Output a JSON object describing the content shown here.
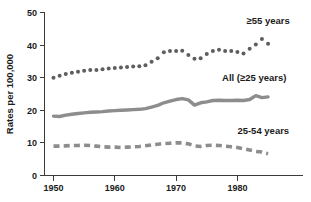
{
  "chart_data": {
    "type": "line",
    "title": "",
    "xlabel": "",
    "ylabel": "Rates per 100,000",
    "xlim": [
      1949,
      1986
    ],
    "ylim": [
      0,
      50
    ],
    "xticks": [
      1950,
      1960,
      1970,
      1980
    ],
    "xtick_labels": [
      "1950",
      "1960",
      "1970",
      "1980"
    ],
    "yticks": [
      0,
      10,
      20,
      30,
      40,
      50
    ],
    "ytick_labels": [
      "0",
      "10",
      "20",
      "30",
      "40",
      "50"
    ],
    "grid": false,
    "legend_position": "inline-right",
    "x": [
      1950,
      1951,
      1952,
      1953,
      1954,
      1955,
      1956,
      1957,
      1958,
      1959,
      1960,
      1961,
      1962,
      1963,
      1964,
      1965,
      1966,
      1967,
      1968,
      1969,
      1970,
      1971,
      1972,
      1973,
      1974,
      1975,
      1976,
      1977,
      1978,
      1979,
      1980,
      1981,
      1982,
      1983,
      1984,
      1985
    ],
    "series": [
      {
        "name": "≥55 years",
        "style": "dotted",
        "color": "#5e5e5e",
        "values": [
          30.0,
          30.6,
          31.1,
          31.5,
          31.8,
          32.1,
          32.4,
          32.4,
          32.6,
          32.8,
          33.0,
          33.1,
          33.3,
          33.4,
          33.5,
          33.8,
          34.9,
          36.0,
          37.8,
          38.2,
          38.2,
          38.3,
          37.0,
          35.8,
          36.0,
          37.3,
          38.2,
          38.6,
          38.2,
          38.2,
          37.9,
          37.4,
          38.9,
          40.2,
          41.9,
          40.4
        ]
      },
      {
        "name": "All (≥25 years)",
        "style": "solid",
        "color": "#8d8d8d",
        "values": [
          18.2,
          18.1,
          18.5,
          18.8,
          19.0,
          19.2,
          19.4,
          19.5,
          19.6,
          19.8,
          19.9,
          20.0,
          20.1,
          20.2,
          20.3,
          20.5,
          21.0,
          21.5,
          22.3,
          22.8,
          23.3,
          23.6,
          23.2,
          21.6,
          22.3,
          22.6,
          23.0,
          23.1,
          23.0,
          23.0,
          23.1,
          23.0,
          23.3,
          24.5,
          23.9,
          24.1
        ]
      },
      {
        "name": "25-54 years",
        "style": "dashed",
        "color": "#8d8d8d",
        "values": [
          9.0,
          9.0,
          9.1,
          9.2,
          9.2,
          9.3,
          9.2,
          9.0,
          8.8,
          8.7,
          8.7,
          8.6,
          8.7,
          8.8,
          8.9,
          9.1,
          9.4,
          9.6,
          9.8,
          9.9,
          10.0,
          10.0,
          9.7,
          9.1,
          8.9,
          9.2,
          9.3,
          9.2,
          9.0,
          8.8,
          8.6,
          8.2,
          7.8,
          7.4,
          7.2,
          6.7
        ]
      }
    ],
    "annotations": [
      {
        "text": "≥55 years",
        "x": 1981.5,
        "y": 46.5,
        "series": "≥55 years"
      },
      {
        "text": "All (≥25 years)",
        "x": 1977.5,
        "y": 29.0,
        "series": "All (≥25 years)"
      },
      {
        "text": "25-54 years",
        "x": 1980.0,
        "y": 12.6,
        "series": "25-54 years"
      }
    ]
  }
}
